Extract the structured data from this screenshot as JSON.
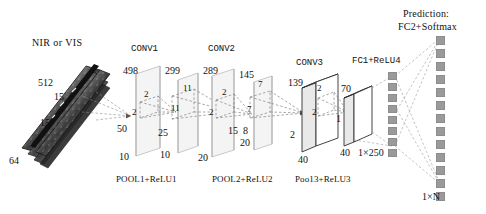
{
  "figure": {
    "title_input": "NIR or VIS",
    "prediction_line1": "Prediction:",
    "prediction_line2": "FC2+Softmax"
  },
  "input_block": {
    "name": "NIR or VIS",
    "depth_label": "512",
    "height_label": "15",
    "width_label": "15",
    "channels_label": "64"
  },
  "stages": [
    {
      "id": "conv1",
      "title": "CONV1",
      "pool_label": "POOL1+ReLU1",
      "plane_a": {
        "top": "498",
        "side": "50",
        "bottom": "10"
      },
      "kernel_a": {
        "w": "2",
        "h": "2"
      },
      "plane_b": {
        "top": "299",
        "side": "25",
        "bottom": "10"
      },
      "kernel_b": {
        "w": "11",
        "h": "11"
      }
    },
    {
      "id": "conv2",
      "title": "CONV2",
      "pool_label": "POOL2+ReLU2",
      "plane_a": {
        "top": "289",
        "side": "15",
        "bottom": "20"
      },
      "kernel_a": {
        "w": "2",
        "h": "2"
      },
      "plane_b": {
        "top": "145",
        "side": "8",
        "bottom": "20"
      },
      "kernel_b": {
        "w": "7",
        "h": "7"
      }
    },
    {
      "id": "conv3",
      "title": "CONV3",
      "pool_label": "Poo13+ReLU3",
      "box_a": {
        "top": "139",
        "side": "2",
        "bottom": "40"
      },
      "kernel_a": {
        "w": "2",
        "h": "2"
      },
      "box_b": {
        "top": "70",
        "side": "1",
        "bottom": "40"
      }
    }
  ],
  "fc_layers": [
    {
      "id": "fc1",
      "title": "FC1+ReLU4",
      "shape_label": "1×250",
      "units": 8
    },
    {
      "id": "fc2",
      "title": "FC2+Softmax",
      "shape_label": "1×N",
      "units": 13
    }
  ],
  "colors": {
    "ink": "#1a1a1a",
    "plane_stroke": "#c9c9c9",
    "plane_fill": "#f2f2f2",
    "box_fill": "#ffffff",
    "box_stroke": "#333333",
    "dashed": "#8a8a8a",
    "neuron": "#9a9a9a"
  }
}
